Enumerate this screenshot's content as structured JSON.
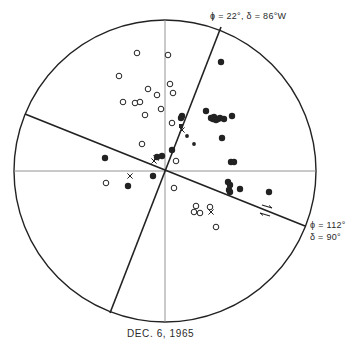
{
  "figure": {
    "caption": "DEC.   6,  1965",
    "plane1_label": "ϕ = 22°,  δ = 86°W",
    "plane2_label_line1": "ϕ = 112°",
    "plane2_label_line2": "δ = 90°"
  },
  "colors": {
    "ink": "#222222",
    "grid": "#888888",
    "background": "#ffffff"
  },
  "diagram": {
    "type": "focal-mechanism stereonet",
    "net": {
      "cx": 165,
      "cy": 171,
      "r": 151
    },
    "nodal_planes": [
      {
        "name": "plane-1",
        "phi": "22°",
        "delta": "86°W",
        "x1": 221,
        "y1": 27,
        "x2": 110,
        "y2": 313
      },
      {
        "name": "plane-2",
        "phi": "112°",
        "delta": "90°",
        "x1": 25,
        "y1": 114,
        "x2": 305,
        "y2": 226
      }
    ],
    "compressions_filled": [
      [
        221,
        62
      ],
      [
        206,
        111
      ],
      [
        211,
        118
      ],
      [
        213,
        119
      ],
      [
        214,
        117
      ],
      [
        216,
        120
      ],
      [
        218,
        119
      ],
      [
        220,
        118
      ],
      [
        224,
        119
      ],
      [
        232,
        116
      ],
      [
        222,
        138
      ],
      [
        231,
        162
      ],
      [
        228,
        182
      ],
      [
        230,
        185
      ],
      [
        229,
        190
      ],
      [
        230,
        192
      ],
      [
        240,
        189
      ],
      [
        269,
        192
      ],
      [
        182,
        116
      ],
      [
        181,
        118
      ],
      [
        172,
        150
      ],
      [
        162,
        156
      ],
      [
        157,
        157
      ],
      [
        105,
        158
      ],
      [
        128,
        186
      ],
      [
        153,
        176
      ],
      [
        234,
        162
      ]
    ],
    "compressions_small": [
      [
        187,
        136
      ],
      [
        194,
        144
      ]
    ],
    "dilatations_open": [
      [
        137,
        53
      ],
      [
        168,
        55
      ],
      [
        119,
        76
      ],
      [
        170,
        84
      ],
      [
        173,
        93
      ],
      [
        148,
        89
      ],
      [
        157,
        95
      ],
      [
        123,
        102
      ],
      [
        135,
        103
      ],
      [
        140,
        102
      ],
      [
        161,
        109
      ],
      [
        145,
        115
      ],
      [
        172,
        123
      ],
      [
        142,
        144
      ],
      [
        176,
        161
      ],
      [
        174,
        188
      ],
      [
        196,
        206
      ],
      [
        194,
        212
      ],
      [
        200,
        213
      ],
      [
        210,
        207
      ],
      [
        216,
        227
      ],
      [
        106,
        183
      ]
    ],
    "crosses": [
      [
        130,
        176
      ],
      [
        182,
        130
      ],
      [
        211,
        212
      ],
      [
        154,
        161
      ],
      [
        156,
        158
      ]
    ],
    "small_squares": [
      [
        181,
        126
      ]
    ],
    "arrows": {
      "upper": {
        "x1": 262,
        "y1": 205,
        "x2": 272,
        "y2": 208,
        "dir": "right"
      },
      "lower": {
        "x1": 260,
        "y1": 213,
        "x2": 270,
        "y2": 216,
        "dir": "left"
      }
    }
  }
}
